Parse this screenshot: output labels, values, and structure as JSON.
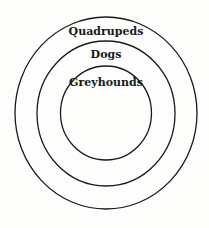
{
  "diagram": {
    "type": "nested-circles (Euler diagram)",
    "sets": [
      {
        "label": "Quadrupeds",
        "level": 0
      },
      {
        "label": "Dogs",
        "level": 1
      },
      {
        "label": "Greyhounds",
        "level": 2
      }
    ],
    "relationships": [
      {
        "subset": "Dogs",
        "superset": "Quadrupeds"
      },
      {
        "subset": "Greyhounds",
        "superset": "Dogs"
      }
    ],
    "colors": {
      "stroke": "#1a1a1a",
      "background": "#fdfdfc"
    }
  }
}
